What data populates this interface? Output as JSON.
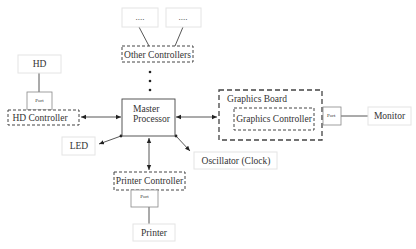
{
  "diagram": {
    "type": "computer-architecture-block-diagram",
    "nodes": {
      "other_1": "....",
      "other_2": "....",
      "other_controllers": "Other Controllers",
      "hd": "HD",
      "hd_port": "Port",
      "hd_controller": "HD Controller",
      "master_processor_line1": "Master",
      "master_processor_line2": "Processor",
      "graphics_board": "Graphics Board",
      "graphics_controller": "Graphics Controller",
      "graphics_port": "Port",
      "monitor": "Monitor",
      "led": "LED",
      "oscillator": "Oscillator (Clock)",
      "printer_controller": "Printer Controller",
      "printer_port": "Port",
      "printer": "Printer"
    },
    "edges": [
      {
        "from": "other_1",
        "to": "other_controllers",
        "style": "line"
      },
      {
        "from": "other_2",
        "to": "other_controllers",
        "style": "line"
      },
      {
        "from": "other_controllers",
        "to": "master_processor",
        "style": "ellipsis-dots"
      },
      {
        "from": "hd",
        "to": "hd_port",
        "style": "line"
      },
      {
        "from": "hd_controller",
        "to": "master_processor",
        "style": "bidirectional-arrow"
      },
      {
        "from": "master_processor",
        "to": "graphics_board",
        "style": "bidirectional-arrow"
      },
      {
        "from": "graphics_port",
        "to": "monitor",
        "style": "line"
      },
      {
        "from": "master_processor",
        "to": "led",
        "style": "arrow"
      },
      {
        "from": "master_processor",
        "to": "oscillator",
        "style": "arrow"
      },
      {
        "from": "master_processor",
        "to": "printer_controller",
        "style": "bidirectional-arrow"
      },
      {
        "from": "printer_port",
        "to": "printer",
        "style": "line"
      }
    ]
  }
}
